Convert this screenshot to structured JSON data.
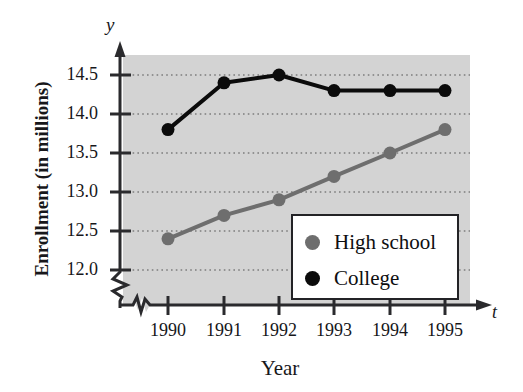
{
  "chart_data": {
    "type": "line",
    "title": "",
    "xlabel": "Year",
    "ylabel": "Enrollment (in millions)",
    "x_axis_variable": "t",
    "y_axis_variable": "y",
    "categories": [
      "1990",
      "1991",
      "1992",
      "1993",
      "1994",
      "1995"
    ],
    "x": [
      1990,
      1991,
      1992,
      1993,
      1994,
      1995
    ],
    "xlim": [
      1989.6,
      1995.5
    ],
    "ylim": [
      11.75,
      14.78
    ],
    "y_ticks": [
      "12.0",
      "12.5",
      "13.0",
      "13.5",
      "14.0",
      "14.5"
    ],
    "y_tick_values": [
      12.0,
      12.5,
      13.0,
      13.5,
      14.0,
      14.5
    ],
    "grid": "horizontal-dotted",
    "y_axis_break": true,
    "x_axis_break": true,
    "legend_position": "lower-right-inside",
    "plot_background": "#d3d3d3",
    "series": [
      {
        "name": "High school",
        "color": "#6e6e6e",
        "values": [
          12.4,
          12.7,
          12.9,
          13.2,
          13.5,
          13.8
        ]
      },
      {
        "name": "College",
        "color": "#0b0b0b",
        "values": [
          13.8,
          14.4,
          14.5,
          14.3,
          14.3,
          14.3
        ]
      }
    ]
  },
  "legend": {
    "items": [
      {
        "label": "High school",
        "color": "#6e6e6e"
      },
      {
        "label": "College",
        "color": "#0b0b0b"
      }
    ]
  },
  "axes": {
    "y_title": "Enrollment (in millions)",
    "x_title": "Year",
    "y_variable": "y",
    "x_variable": "t",
    "y_tick_labels": [
      "14.5",
      "14.0",
      "13.5",
      "13.0",
      "12.5",
      "12.0"
    ],
    "x_tick_labels": [
      "1990",
      "1991",
      "1992",
      "1993",
      "1994",
      "1995"
    ]
  },
  "colors": {
    "plot_fill": "#d3d3d3",
    "axis": "#2a2a2d",
    "grid": "#8a8a8a",
    "high_school": "#6e6e6e",
    "college": "#0b0b0b",
    "text": "#17171a"
  }
}
